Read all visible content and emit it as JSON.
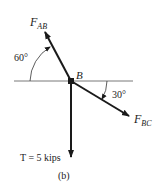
{
  "diagram": {
    "type": "free-body-diagram",
    "caption": "(b)",
    "point": {
      "label": "B"
    },
    "forces": [
      {
        "id": "F_AB",
        "label_main": "F",
        "label_sub": "AB",
        "direction": "up-left"
      },
      {
        "id": "F_BC",
        "label_main": "F",
        "label_sub": "BC",
        "direction": "down-right"
      },
      {
        "id": "T",
        "label": "T = 5 kips",
        "direction": "down"
      }
    ],
    "angles": [
      {
        "value": "60°",
        "between": "horizontal and F_AB"
      },
      {
        "value": "30°",
        "between": "horizontal and F_BC"
      }
    ],
    "colors": {
      "line": "#1a1a1a",
      "reference_line": "#555555",
      "text": "#222222"
    }
  }
}
